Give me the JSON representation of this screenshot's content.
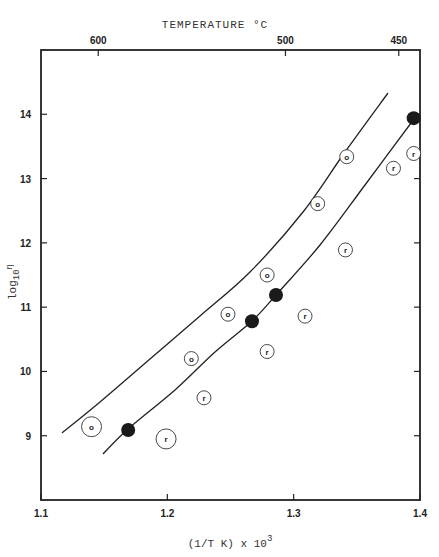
{
  "chart_data": {
    "type": "scatter",
    "title": "",
    "top_axis_label": "TEMPERATURE °C",
    "xlabel": "(1/T K) x 10",
    "xlabel_superscript": "3",
    "ylabel": "log",
    "ylabel_sub": "10",
    "ylabel_symbol": "η",
    "xlim": [
      1.1,
      1.4
    ],
    "ylim": [
      8.0,
      15.0
    ],
    "grid": false,
    "x_ticks": [
      1.1,
      1.2,
      1.3,
      1.4
    ],
    "x_tick_labels": [
      "1.1",
      "1.2",
      "1.3",
      "1.4"
    ],
    "y_ticks": [
      9,
      10,
      11,
      12,
      13,
      14
    ],
    "y_tick_labels": [
      "9",
      "10",
      "11",
      "12",
      "13",
      "14"
    ],
    "top_ticks": [
      {
        "label": "600",
        "x": 1.1453
      },
      {
        "label": "500",
        "x": 1.2935
      },
      {
        "label": "450",
        "x": 1.3832
      }
    ],
    "series": [
      {
        "name": "filled",
        "marker": "filled-circle",
        "points": [
          {
            "x": 1.169,
            "y": 9.09
          },
          {
            "x": 1.267,
            "y": 10.78
          },
          {
            "x": 1.286,
            "y": 11.19
          },
          {
            "x": 1.395,
            "y": 13.94
          }
        ]
      },
      {
        "name": "o",
        "marker": "circle-label",
        "label": "o",
        "points": [
          {
            "x": 1.14,
            "y": 9.14,
            "size": "large"
          },
          {
            "x": 1.219,
            "y": 10.2
          },
          {
            "x": 1.248,
            "y": 10.89
          },
          {
            "x": 1.279,
            "y": 11.5
          },
          {
            "x": 1.319,
            "y": 12.61
          },
          {
            "x": 1.342,
            "y": 13.34
          }
        ]
      },
      {
        "name": "r",
        "marker": "circle-label",
        "label": "r",
        "points": [
          {
            "x": 1.199,
            "y": 8.95,
            "size": "large"
          },
          {
            "x": 1.229,
            "y": 9.59
          },
          {
            "x": 1.279,
            "y": 10.31
          },
          {
            "x": 1.309,
            "y": 10.86
          },
          {
            "x": 1.341,
            "y": 11.89
          },
          {
            "x": 1.379,
            "y": 13.16
          },
          {
            "x": 1.395,
            "y": 13.39
          }
        ]
      }
    ],
    "curves": [
      {
        "name": "upper-curve",
        "points": [
          {
            "x": 1.116,
            "y": 9.03
          },
          {
            "x": 1.147,
            "y": 9.5
          },
          {
            "x": 1.1867,
            "y": 10.17
          },
          {
            "x": 1.226,
            "y": 10.86
          },
          {
            "x": 1.2665,
            "y": 11.66
          },
          {
            "x": 1.3075,
            "y": 12.5
          },
          {
            "x": 1.348,
            "y": 13.4
          },
          {
            "x": 1.3747,
            "y": 14.34
          }
        ]
      },
      {
        "name": "lower-curve",
        "points": [
          {
            "x": 1.149,
            "y": 8.72
          },
          {
            "x": 1.169,
            "y": 9.09
          },
          {
            "x": 1.2825,
            "y": 9.87
          },
          {
            "x": 1.267,
            "y": 10.78
          },
          {
            "x": 1.286,
            "y": 11.19
          },
          {
            "x": 1.3212,
            "y": 12.05
          },
          {
            "x": 1.36,
            "y": 12.98
          },
          {
            "x": 1.395,
            "y": 13.94
          }
        ]
      }
    ]
  }
}
